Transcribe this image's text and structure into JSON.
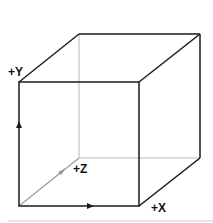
{
  "diagram": {
    "type": "3d-axis-cube",
    "colors": {
      "front_edges": "#1a1a1a",
      "hidden_edges": "#b5b5b5",
      "z_axis": "#9a9a9a",
      "background": "#ffffff"
    },
    "axes": {
      "x": {
        "label": "+X"
      },
      "y": {
        "label": "+Y"
      },
      "z": {
        "label": "+Z"
      }
    }
  }
}
